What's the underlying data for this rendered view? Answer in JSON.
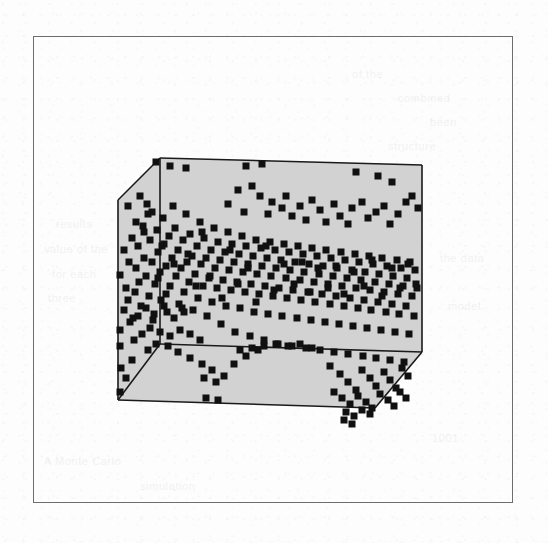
{
  "figure": {
    "type": "3d-scatter",
    "caption": "",
    "frame": {
      "x": 33,
      "y": 36,
      "width": 480,
      "height": 467,
      "border_color": "#6d6d6d"
    },
    "box": {
      "fill_color": "#d2d2d2",
      "stroke_color": "#1a1a1a",
      "stroke_width": 1.6,
      "description": "cuboid axis box in oblique projection, gray shaded faces",
      "vertices": {
        "back_top_left": [
          160,
          158
        ],
        "back_top_right": [
          422,
          165
        ],
        "back_bottom_left": [
          160,
          344
        ],
        "back_bottom_right": [
          422,
          352
        ],
        "front_top_left": [
          118,
          200
        ],
        "front_bottom_left": [
          118,
          400
        ],
        "front_bottom_right": [
          375,
          408
        ],
        "front_right_lower": [
          422,
          352
        ]
      }
    },
    "marker": {
      "shape": "square",
      "color": "#101010",
      "size_px": 7
    }
  },
  "ghost_text": [
    {
      "text": "of the",
      "x": 352,
      "y": 68
    },
    {
      "text": "combined",
      "x": 398,
      "y": 92
    },
    {
      "text": "been",
      "x": 430,
      "y": 116
    },
    {
      "text": "structure",
      "x": 388,
      "y": 140
    },
    {
      "text": "results",
      "x": 56,
      "y": 218
    },
    {
      "text": "value of the",
      "x": 44,
      "y": 243
    },
    {
      "text": "for each",
      "x": 52,
      "y": 268
    },
    {
      "text": "three",
      "x": 48,
      "y": 292
    },
    {
      "text": "the data",
      "x": 440,
      "y": 252
    },
    {
      "text": "model",
      "x": 448,
      "y": 300
    },
    {
      "text": "A Monte Carlo",
      "x": 44,
      "y": 455
    },
    {
      "text": "simulation",
      "x": 140,
      "y": 480
    },
    {
      "text": "1001",
      "x": 432,
      "y": 432
    }
  ],
  "chart_data": {
    "type": "scatter",
    "projection": "3d-oblique",
    "title": "",
    "xlabel": "",
    "ylabel": "",
    "zlabel": "",
    "grid": false,
    "legend": null,
    "axis_ticks": {
      "x": [],
      "y": [],
      "z": []
    },
    "marker_style": {
      "shape": "square",
      "color": "#101010",
      "size_px": 7
    },
    "n_points": 392,
    "points": [
      [
        120,
        275
      ],
      [
        120,
        330
      ],
      [
        120,
        346
      ],
      [
        121,
        368
      ],
      [
        124,
        250
      ],
      [
        126,
        288
      ],
      [
        128,
        300
      ],
      [
        129,
        262
      ],
      [
        132,
        238
      ],
      [
        133,
        318
      ],
      [
        135,
        292
      ],
      [
        136,
        268
      ],
      [
        138,
        246
      ],
      [
        139,
        282
      ],
      [
        141,
        306
      ],
      [
        143,
        226
      ],
      [
        144,
        258
      ],
      [
        146,
        276
      ],
      [
        148,
        214
      ],
      [
        149,
        296
      ],
      [
        150,
        240
      ],
      [
        152,
        262
      ],
      [
        153,
        320
      ],
      [
        155,
        284
      ],
      [
        157,
        230
      ],
      [
        158,
        252
      ],
      [
        160,
        272
      ],
      [
        161,
        300
      ],
      [
        163,
        218
      ],
      [
        164,
        244
      ],
      [
        166,
        266
      ],
      [
        167,
        312
      ],
      [
        169,
        236
      ],
      [
        170,
        286
      ],
      [
        172,
        258
      ],
      [
        173,
        206
      ],
      [
        175,
        228
      ],
      [
        176,
        276
      ],
      [
        178,
        250
      ],
      [
        179,
        304
      ],
      [
        181,
        268
      ],
      [
        183,
        240
      ],
      [
        184,
        292
      ],
      [
        186,
        214
      ],
      [
        187,
        262
      ],
      [
        189,
        282
      ],
      [
        190,
        234
      ],
      [
        192,
        256
      ],
      [
        193,
        310
      ],
      [
        195,
        274
      ],
      [
        197,
        246
      ],
      [
        198,
        298
      ],
      [
        200,
        222
      ],
      [
        201,
        264
      ],
      [
        203,
        286
      ],
      [
        204,
        238
      ],
      [
        206,
        258
      ],
      [
        207,
        316
      ],
      [
        209,
        278
      ],
      [
        211,
        250
      ],
      [
        212,
        302
      ],
      [
        214,
        228
      ],
      [
        215,
        268
      ],
      [
        217,
        288
      ],
      [
        218,
        242
      ],
      [
        220,
        260
      ],
      [
        221,
        324
      ],
      [
        223,
        280
      ],
      [
        225,
        252
      ],
      [
        226,
        306
      ],
      [
        228,
        232
      ],
      [
        229,
        270
      ],
      [
        231,
        290
      ],
      [
        232,
        244
      ],
      [
        234,
        262
      ],
      [
        235,
        332
      ],
      [
        237,
        282
      ],
      [
        239,
        254
      ],
      [
        240,
        308
      ],
      [
        242,
        236
      ],
      [
        243,
        272
      ],
      [
        245,
        292
      ],
      [
        246,
        246
      ],
      [
        248,
        264
      ],
      [
        250,
        336
      ],
      [
        251,
        284
      ],
      [
        253,
        256
      ],
      [
        254,
        312
      ],
      [
        256,
        240
      ],
      [
        257,
        274
      ],
      [
        259,
        294
      ],
      [
        261,
        248
      ],
      [
        262,
        266
      ],
      [
        264,
        340
      ],
      [
        265,
        286
      ],
      [
        267,
        258
      ],
      [
        268,
        314
      ],
      [
        270,
        242
      ],
      [
        271,
        276
      ],
      [
        273,
        296
      ],
      [
        275,
        250
      ],
      [
        276,
        268
      ],
      [
        278,
        344
      ],
      [
        279,
        288
      ],
      [
        281,
        260
      ],
      [
        282,
        316
      ],
      [
        284,
        244
      ],
      [
        286,
        278
      ],
      [
        287,
        298
      ],
      [
        289,
        252
      ],
      [
        290,
        270
      ],
      [
        292,
        346
      ],
      [
        293,
        290
      ],
      [
        295,
        262
      ],
      [
        297,
        318
      ],
      [
        298,
        246
      ],
      [
        300,
        280
      ],
      [
        301,
        300
      ],
      [
        303,
        254
      ],
      [
        304,
        272
      ],
      [
        306,
        348
      ],
      [
        308,
        292
      ],
      [
        309,
        264
      ],
      [
        311,
        320
      ],
      [
        312,
        248
      ],
      [
        314,
        282
      ],
      [
        315,
        302
      ],
      [
        317,
        256
      ],
      [
        319,
        274
      ],
      [
        320,
        350
      ],
      [
        322,
        294
      ],
      [
        323,
        266
      ],
      [
        325,
        322
      ],
      [
        326,
        250
      ],
      [
        328,
        284
      ],
      [
        330,
        304
      ],
      [
        331,
        258
      ],
      [
        333,
        276
      ],
      [
        334,
        352
      ],
      [
        336,
        296
      ],
      [
        337,
        268
      ],
      [
        339,
        324
      ],
      [
        341,
        252
      ],
      [
        342,
        286
      ],
      [
        344,
        306
      ],
      [
        345,
        260
      ],
      [
        347,
        278
      ],
      [
        348,
        354
      ],
      [
        350,
        298
      ],
      [
        352,
        270
      ],
      [
        353,
        326
      ],
      [
        355,
        254
      ],
      [
        356,
        288
      ],
      [
        358,
        308
      ],
      [
        359,
        262
      ],
      [
        361,
        280
      ],
      [
        363,
        356
      ],
      [
        364,
        300
      ],
      [
        365,
        272
      ],
      [
        367,
        328
      ],
      [
        369,
        256
      ],
      [
        370,
        290
      ],
      [
        371,
        310
      ],
      [
        373,
        264
      ],
      [
        375,
        282
      ],
      [
        376,
        358
      ],
      [
        378,
        302
      ],
      [
        379,
        274
      ],
      [
        381,
        330
      ],
      [
        382,
        258
      ],
      [
        384,
        292
      ],
      [
        386,
        312
      ],
      [
        387,
        266
      ],
      [
        389,
        284
      ],
      [
        390,
        360
      ],
      [
        392,
        304
      ],
      [
        393,
        276
      ],
      [
        395,
        332
      ],
      [
        397,
        260
      ],
      [
        398,
        294
      ],
      [
        399,
        314
      ],
      [
        401,
        268
      ],
      [
        403,
        286
      ],
      [
        404,
        362
      ],
      [
        406,
        306
      ],
      [
        407,
        278
      ],
      [
        409,
        334
      ],
      [
        410,
        262
      ],
      [
        412,
        296
      ],
      [
        414,
        316
      ],
      [
        415,
        270
      ],
      [
        417,
        288
      ],
      [
        156,
        162
      ],
      [
        170,
        166
      ],
      [
        186,
        168
      ],
      [
        246,
        166
      ],
      [
        262,
        164
      ],
      [
        356,
        172
      ],
      [
        378,
        176
      ],
      [
        392,
        182
      ],
      [
        140,
        196
      ],
      [
        147,
        204
      ],
      [
        152,
        212
      ],
      [
        136,
        222
      ],
      [
        144,
        232
      ],
      [
        128,
        206
      ],
      [
        238,
        190
      ],
      [
        252,
        186
      ],
      [
        260,
        196
      ],
      [
        272,
        202
      ],
      [
        228,
        204
      ],
      [
        244,
        212
      ],
      [
        268,
        214
      ],
      [
        282,
        208
      ],
      [
        292,
        216
      ],
      [
        286,
        196
      ],
      [
        300,
        206
      ],
      [
        312,
        200
      ],
      [
        306,
        220
      ],
      [
        320,
        210
      ],
      [
        334,
        204
      ],
      [
        326,
        222
      ],
      [
        340,
        216
      ],
      [
        352,
        208
      ],
      [
        362,
        202
      ],
      [
        348,
        224
      ],
      [
        368,
        218
      ],
      [
        376,
        212
      ],
      [
        384,
        206
      ],
      [
        390,
        224
      ],
      [
        398,
        214
      ],
      [
        406,
        202
      ],
      [
        412,
        196
      ],
      [
        418,
        208
      ],
      [
        120,
        392
      ],
      [
        126,
        378
      ],
      [
        132,
        360
      ],
      [
        148,
        350
      ],
      [
        156,
        344
      ],
      [
        168,
        346
      ],
      [
        178,
        352
      ],
      [
        190,
        358
      ],
      [
        202,
        364
      ],
      [
        212,
        370
      ],
      [
        224,
        376
      ],
      [
        234,
        364
      ],
      [
        246,
        356
      ],
      [
        258,
        350
      ],
      [
        204,
        378
      ],
      [
        216,
        382
      ],
      [
        206,
        398
      ],
      [
        218,
        400
      ],
      [
        330,
        366
      ],
      [
        340,
        374
      ],
      [
        348,
        382
      ],
      [
        356,
        390
      ],
      [
        362,
        370
      ],
      [
        370,
        378
      ],
      [
        376,
        386
      ],
      [
        384,
        372
      ],
      [
        390,
        380
      ],
      [
        396,
        388
      ],
      [
        402,
        368
      ],
      [
        408,
        376
      ],
      [
        334,
        392
      ],
      [
        342,
        398
      ],
      [
        350,
        404
      ],
      [
        358,
        396
      ],
      [
        366,
        402
      ],
      [
        372,
        408
      ],
      [
        380,
        394
      ],
      [
        388,
        400
      ],
      [
        394,
        406
      ],
      [
        400,
        392
      ],
      [
        406,
        398
      ],
      [
        346,
        412
      ],
      [
        354,
        416
      ],
      [
        362,
        410
      ],
      [
        370,
        414
      ],
      [
        344,
        420
      ],
      [
        352,
        424
      ],
      [
        300,
        344
      ],
      [
        312,
        348
      ],
      [
        288,
        346
      ],
      [
        276,
        344
      ],
      [
        264,
        346
      ],
      [
        252,
        348
      ],
      [
        240,
        350
      ],
      [
        158,
        278
      ],
      [
        162,
        246
      ],
      [
        166,
        294
      ],
      [
        174,
        264
      ],
      [
        182,
        308
      ],
      [
        188,
        254
      ],
      [
        196,
        286
      ],
      [
        202,
        232
      ],
      [
        210,
        276
      ],
      [
        222,
        298
      ],
      [
        230,
        250
      ],
      [
        238,
        284
      ],
      [
        248,
        268
      ],
      [
        256,
        302
      ],
      [
        266,
        246
      ],
      [
        274,
        290
      ],
      [
        284,
        264
      ],
      [
        294,
        284
      ],
      [
        302,
        262
      ],
      [
        310,
        292
      ],
      [
        318,
        268
      ],
      [
        328,
        288
      ],
      [
        336,
        266
      ],
      [
        344,
        294
      ],
      [
        354,
        272
      ],
      [
        364,
        286
      ],
      [
        372,
        260
      ],
      [
        382,
        296
      ],
      [
        392,
        268
      ],
      [
        400,
        288
      ],
      [
        408,
        264
      ],
      [
        416,
        284
      ],
      [
        134,
        340
      ],
      [
        142,
        334
      ],
      [
        150,
        328
      ],
      [
        160,
        332
      ],
      [
        170,
        336
      ],
      [
        180,
        330
      ],
      [
        190,
        334
      ],
      [
        200,
        340
      ],
      [
        124,
        310
      ],
      [
        130,
        322
      ],
      [
        138,
        316
      ],
      [
        146,
        308
      ],
      [
        154,
        314
      ],
      [
        164,
        306
      ],
      [
        174,
        318
      ],
      [
        184,
        312
      ]
    ]
  }
}
